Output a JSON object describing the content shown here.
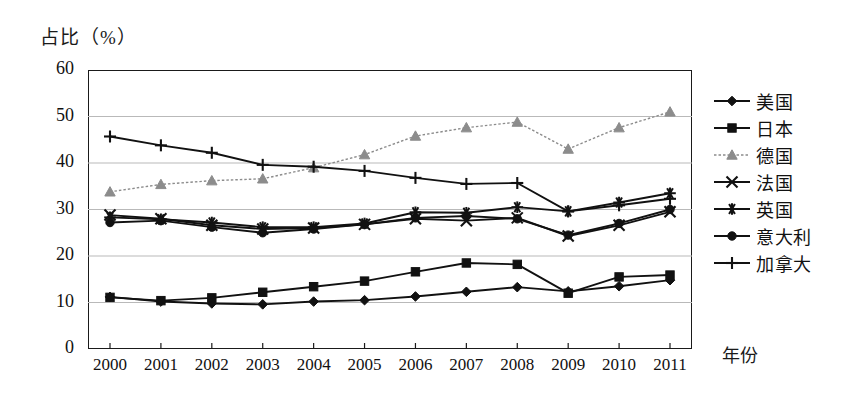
{
  "chart_data": {
    "type": "line",
    "title": "",
    "ylabel": "占比（%）",
    "xlabel": "年份",
    "grid": true,
    "legend_position": "right",
    "ylim": [
      0,
      60
    ],
    "ytick_values": [
      0,
      10,
      20,
      30,
      40,
      50,
      60
    ],
    "categories": [
      "2000",
      "2001",
      "2002",
      "2003",
      "2004",
      "2005",
      "2006",
      "2007",
      "2008",
      "2009",
      "2010",
      "2011"
    ],
    "series": [
      {
        "name": "美国",
        "marker": "diamond",
        "color": "#111111",
        "values": [
          11.2,
          10.2,
          9.8,
          9.6,
          10.2,
          10.5,
          11.3,
          12.3,
          13.3,
          12.4,
          13.5,
          14.8
        ]
      },
      {
        "name": "日本",
        "marker": "square",
        "color": "#111111",
        "values": [
          11.1,
          10.4,
          11.0,
          12.2,
          13.4,
          14.6,
          16.6,
          18.5,
          18.2,
          12.0,
          15.5,
          15.9
        ]
      },
      {
        "name": "德国",
        "marker": "triangle",
        "color": "#8c8c8c",
        "values": [
          33.8,
          35.4,
          36.2,
          36.6,
          39.0,
          41.8,
          45.8,
          47.6,
          48.8,
          43.0,
          47.6,
          51.0
        ]
      },
      {
        "name": "法国",
        "marker": "cross",
        "color": "#111111",
        "values": [
          28.8,
          28.0,
          26.6,
          25.8,
          26.0,
          26.8,
          28.0,
          27.6,
          28.2,
          24.3,
          26.6,
          29.5
        ]
      },
      {
        "name": "英国",
        "marker": "asterisk",
        "color": "#111111",
        "values": [
          28.3,
          27.9,
          27.2,
          26.2,
          26.2,
          27.0,
          29.4,
          29.3,
          30.5,
          29.6,
          31.5,
          33.5
        ]
      },
      {
        "name": "意大利",
        "marker": "circle",
        "color": "#111111",
        "values": [
          27.2,
          27.6,
          26.2,
          25.0,
          25.8,
          26.8,
          28.2,
          28.6,
          28.0,
          24.5,
          27.0,
          30.0
        ]
      },
      {
        "name": "加拿大",
        "marker": "plus",
        "color": "#111111",
        "values": [
          45.7,
          43.8,
          42.2,
          39.6,
          39.2,
          38.3,
          36.8,
          35.5,
          35.7,
          29.6,
          30.9,
          32.3
        ]
      }
    ]
  }
}
